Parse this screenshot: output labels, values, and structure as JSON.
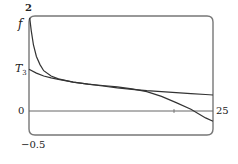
{
  "chart_data": {
    "type": "line",
    "title": "",
    "xlabel": "",
    "ylabel": "",
    "xlim": [
      0,
      25
    ],
    "ylim": [
      -0.5,
      2
    ],
    "grid": false,
    "legend": null,
    "tick_labels": {
      "y_top": "2",
      "y_zero": "0",
      "y_bottom": "-0.5",
      "x_right": "25"
    },
    "x_ticks": [
      20
    ],
    "series": [
      {
        "name": "f",
        "label": "f",
        "color": "#333333",
        "x": [
          0.1,
          0.3,
          0.6,
          1,
          1.5,
          2,
          3,
          4,
          6,
          8,
          10,
          12,
          14,
          16,
          18,
          20,
          22,
          24,
          25
        ],
        "y": [
          1.96,
          1.7,
          1.4,
          1.15,
          0.98,
          0.85,
          0.74,
          0.68,
          0.61,
          0.57,
          0.54,
          0.51,
          0.47,
          0.41,
          0.31,
          0.18,
          0.04,
          -0.14,
          -0.21
        ]
      },
      {
        "name": "T3",
        "label": "T",
        "label_sub": "3",
        "color": "#333333",
        "x": [
          0,
          1,
          2,
          3,
          4,
          6,
          8,
          10,
          12,
          14,
          16,
          18,
          20,
          22,
          24,
          25
        ],
        "y": [
          0.88,
          0.8,
          0.74,
          0.7,
          0.67,
          0.61,
          0.57,
          0.53,
          0.49,
          0.46,
          0.43,
          0.41,
          0.39,
          0.37,
          0.35,
          0.34
        ]
      }
    ],
    "annotations": [
      {
        "text": "f",
        "near": "left axis, upper"
      },
      {
        "text": "T3",
        "near": "left axis, start of T3 line"
      }
    ]
  },
  "labels": {
    "y_top": "2",
    "f": "f",
    "t": "T",
    "t_sub": "3",
    "zero": "0",
    "y_bottom": "−0.5",
    "x_right": "25"
  }
}
